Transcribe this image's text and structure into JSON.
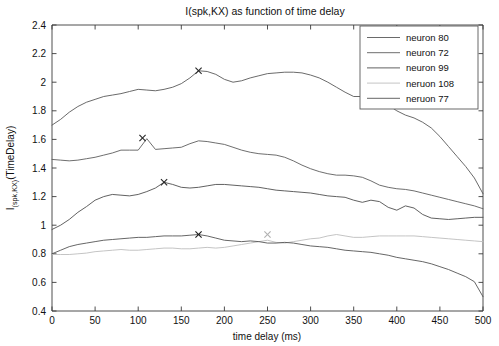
{
  "chart_data": {
    "type": "line",
    "title": "I(spk,KX) as function of time delay",
    "xlabel": "time delay (ms)",
    "ylabel_main": "I",
    "ylabel_sub": "(spk,KX)",
    "ylabel_tail": "(TimeDelay)",
    "xlim": [
      0,
      500
    ],
    "ylim": [
      0.4,
      2.4
    ],
    "xticks": [
      0,
      50,
      100,
      150,
      200,
      250,
      300,
      350,
      400,
      450,
      500
    ],
    "yticks": [
      0.4,
      0.6,
      0.8,
      1,
      1.2,
      1.4,
      1.6,
      1.8,
      2,
      2.2,
      2.4
    ],
    "xtick_labels": [
      "0",
      "50",
      "100",
      "150",
      "200",
      "250",
      "300",
      "350",
      "400",
      "450",
      "500"
    ],
    "ytick_labels": [
      "0.4",
      "0.6",
      "0.8",
      "1",
      "1.2",
      "1.4",
      "1.6",
      "1.8",
      "2",
      "2.2",
      "2.4"
    ],
    "grid": false,
    "legend_position": "top-right",
    "x": [
      0,
      10,
      20,
      30,
      40,
      50,
      60,
      70,
      80,
      90,
      100,
      110,
      120,
      130,
      140,
      150,
      160,
      170,
      180,
      190,
      200,
      210,
      220,
      230,
      240,
      250,
      260,
      270,
      280,
      290,
      300,
      310,
      320,
      330,
      340,
      350,
      360,
      370,
      380,
      390,
      400,
      410,
      420,
      430,
      440,
      450,
      460,
      470,
      480,
      490,
      500
    ],
    "series": [
      {
        "name": "neuron 80",
        "color": "#595959",
        "peak_marker": {
          "x": 170,
          "y": 2.08,
          "color": "#262626"
        },
        "values": [
          1.7,
          1.74,
          1.79,
          1.83,
          1.86,
          1.88,
          1.9,
          1.91,
          1.92,
          1.935,
          1.95,
          1.945,
          1.94,
          1.95,
          1.965,
          1.99,
          2.03,
          2.08,
          2.075,
          2.055,
          2.02,
          2.0,
          2.01,
          2.03,
          2.045,
          2.06,
          2.065,
          2.07,
          2.07,
          2.065,
          2.05,
          2.03,
          2.0,
          1.965,
          1.93,
          1.9,
          1.9,
          1.905,
          1.88,
          1.84,
          1.8,
          1.77,
          1.75,
          1.72,
          1.68,
          1.62,
          1.55,
          1.48,
          1.41,
          1.33,
          1.22
        ]
      },
      {
        "name": "neuron 72",
        "color": "#5e5e5e",
        "peak_marker": {
          "x": 105,
          "y": 1.61,
          "color": "#262626"
        },
        "values": [
          1.46,
          1.455,
          1.45,
          1.455,
          1.465,
          1.475,
          1.49,
          1.505,
          1.525,
          1.525,
          1.525,
          1.605,
          1.53,
          1.535,
          1.54,
          1.545,
          1.57,
          1.59,
          1.585,
          1.575,
          1.565,
          1.545,
          1.525,
          1.51,
          1.5,
          1.495,
          1.49,
          1.475,
          1.45,
          1.42,
          1.395,
          1.375,
          1.36,
          1.35,
          1.35,
          1.345,
          1.335,
          1.31,
          1.28,
          1.265,
          1.255,
          1.25,
          1.24,
          1.225,
          1.21,
          1.195,
          1.18,
          1.165,
          1.15,
          1.135,
          1.115
        ]
      },
      {
        "name": "neuron 99",
        "color": "#4f4f4f",
        "peak_marker": {
          "x": 130,
          "y": 1.3,
          "color": "#262626"
        },
        "values": [
          0.97,
          1.0,
          1.04,
          1.09,
          1.13,
          1.175,
          1.2,
          1.215,
          1.21,
          1.205,
          1.215,
          1.235,
          1.26,
          1.3,
          1.285,
          1.265,
          1.26,
          1.265,
          1.275,
          1.285,
          1.285,
          1.28,
          1.275,
          1.27,
          1.265,
          1.255,
          1.245,
          1.24,
          1.235,
          1.23,
          1.225,
          1.215,
          1.205,
          1.2,
          1.195,
          1.175,
          1.16,
          1.175,
          1.165,
          1.125,
          1.105,
          1.135,
          1.12,
          1.075,
          1.05,
          1.045,
          1.04,
          1.045,
          1.05,
          1.055,
          1.055
        ]
      },
      {
        "name": "neruon 108",
        "color": "#bdbdbd",
        "peak_marker": {
          "x": 250,
          "y": 0.935,
          "color": "#b0b0b0"
        },
        "values": [
          0.795,
          0.795,
          0.795,
          0.8,
          0.805,
          0.815,
          0.82,
          0.825,
          0.83,
          0.825,
          0.825,
          0.83,
          0.835,
          0.84,
          0.84,
          0.835,
          0.835,
          0.84,
          0.845,
          0.84,
          0.845,
          0.855,
          0.865,
          0.875,
          0.885,
          0.895,
          0.88,
          0.875,
          0.885,
          0.895,
          0.905,
          0.91,
          0.925,
          0.935,
          0.925,
          0.915,
          0.915,
          0.92,
          0.925,
          0.925,
          0.925,
          0.925,
          0.925,
          0.92,
          0.915,
          0.91,
          0.905,
          0.9,
          0.895,
          0.89,
          0.885
        ]
      },
      {
        "name": "neruon 77",
        "color": "#555555",
        "peak_marker": {
          "x": 170,
          "y": 0.935,
          "color": "#1c1c1c"
        },
        "values": [
          0.8,
          0.825,
          0.85,
          0.865,
          0.875,
          0.885,
          0.895,
          0.9,
          0.905,
          0.91,
          0.915,
          0.915,
          0.92,
          0.925,
          0.925,
          0.925,
          0.93,
          0.935,
          0.925,
          0.91,
          0.895,
          0.89,
          0.885,
          0.89,
          0.885,
          0.875,
          0.875,
          0.88,
          0.875,
          0.865,
          0.855,
          0.85,
          0.845,
          0.835,
          0.825,
          0.82,
          0.815,
          0.81,
          0.8,
          0.79,
          0.775,
          0.765,
          0.755,
          0.745,
          0.73,
          0.71,
          0.69,
          0.665,
          0.64,
          0.605,
          0.5
        ]
      }
    ]
  }
}
